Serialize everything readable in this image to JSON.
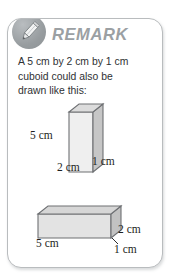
{
  "card": {
    "header": {
      "icon": "pencil-icon",
      "title": "REMARK"
    },
    "body": {
      "lines": [
        "A 5 cm by 2 cm by 1 cm",
        "cuboid could also be",
        "drawn like this:"
      ]
    },
    "figures": [
      {
        "id": "vertical-cuboid",
        "orientation": "vertical",
        "labels": {
          "height": "5 cm",
          "width": "2 cm",
          "depth": "1 cm"
        }
      },
      {
        "id": "horizontal-cuboid",
        "orientation": "horizontal",
        "labels": {
          "length": "5 cm",
          "height": "2 cm",
          "depth": "1 cm"
        }
      }
    ]
  },
  "colors": {
    "card_border": "#b9bcbe",
    "title_gray": "#9ba0a3",
    "badge_gray": "#9a9fa2",
    "face_front": "#efefef",
    "face_side": "#c8c8c8",
    "face_top": "#d9d9d9",
    "outline": "#6e7073",
    "text": "#2f3133"
  }
}
